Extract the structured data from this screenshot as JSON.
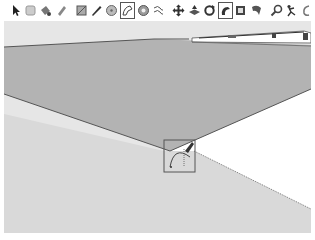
{
  "app": {
    "name": "3D modeling viewport",
    "colors": {
      "sky": "#e6e6e6",
      "ground": "#d9d9d9",
      "face_top": "#b3b3b3",
      "edge": "#555555",
      "white_face": "#ffffff",
      "toolbar_bg": "#ffffff",
      "active_border": "#555555"
    }
  },
  "toolbar": {
    "tools": [
      {
        "id": "select",
        "icon": "arrow-cursor-icon",
        "active": false
      },
      {
        "id": "eraser",
        "icon": "eraser-icon",
        "active": false
      },
      {
        "id": "paint-bucket",
        "icon": "paint-bucket-icon",
        "active": false
      },
      {
        "id": "tape",
        "icon": "tape-measure-icon",
        "active": false
      },
      {
        "id": "rectangle",
        "icon": "rectangle-icon",
        "active": false
      },
      {
        "id": "line",
        "icon": "pencil-line-icon",
        "active": false
      },
      {
        "id": "circle",
        "icon": "circle-icon",
        "active": false
      },
      {
        "id": "arc",
        "icon": "arc-icon",
        "active": true
      },
      {
        "id": "polygon",
        "icon": "polygon-icon",
        "active": false
      },
      {
        "id": "freehand",
        "icon": "freehand-icon",
        "active": false
      },
      {
        "id": "move",
        "icon": "move-icon",
        "active": false
      },
      {
        "id": "push-pull",
        "icon": "push-pull-icon",
        "active": false
      },
      {
        "id": "rotate",
        "icon": "rotate-icon",
        "active": false
      },
      {
        "id": "follow-me",
        "icon": "follow-me-icon",
        "active": false
      },
      {
        "id": "scale",
        "icon": "scale-icon",
        "active": false
      },
      {
        "id": "offset",
        "icon": "offset-icon",
        "active": false
      },
      {
        "id": "zoom",
        "icon": "zoom-magnifier-icon",
        "active": false
      },
      {
        "id": "walk",
        "icon": "walk-icon",
        "active": false
      },
      {
        "id": "orbit",
        "icon": "orbit-icon",
        "active": false
      }
    ]
  },
  "viewport": {
    "cursor": {
      "tool": "arc",
      "icon": "arc-cursor-icon",
      "x": 165,
      "y": 140,
      "w": 30,
      "h": 32
    },
    "shapes": [
      {
        "name": "top-face",
        "fill": "#b3b3b3"
      },
      {
        "name": "ground-face",
        "fill": "#d9d9d9"
      },
      {
        "name": "white-face",
        "fill": "#ffffff"
      },
      {
        "name": "distant-structure",
        "fill": "#ffffff"
      }
    ]
  }
}
